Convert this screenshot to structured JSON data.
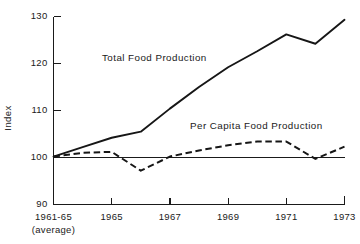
{
  "chart_data": {
    "type": "line",
    "title": "",
    "xlabel": "",
    "ylabel": "Index",
    "ylim": [
      90,
      130
    ],
    "yticks": [
      90,
      100,
      110,
      120,
      130
    ],
    "ytick_labels": [
      "90",
      "100",
      "110",
      "120",
      "130"
    ],
    "grid": false,
    "legend_position": "inline-annotation",
    "reference_line": 100,
    "x": [
      1963,
      1964,
      1965,
      1966,
      1967,
      1968,
      1969,
      1970,
      1971,
      1972,
      1973
    ],
    "xtick_positions": [
      1963,
      1965,
      1967,
      1969,
      1971,
      1973
    ],
    "xtick_labels": [
      "1961-65",
      "1965",
      "1967",
      "1969",
      "1971",
      "1973"
    ],
    "xtick_sublabel": "(average)",
    "series": [
      {
        "name": "Total Food Production",
        "style": "solid",
        "values": [
          100.2,
          102.2,
          104.2,
          105.5,
          110.4,
          115.0,
          119.2,
          122.6,
          126.2,
          124.2,
          129.3
        ]
      },
      {
        "name": "Per Capita Food Production",
        "style": "dashed",
        "values": [
          100.2,
          101.0,
          101.2,
          97.2,
          100.2,
          101.5,
          102.6,
          103.4,
          103.4,
          99.7,
          102.3
        ]
      }
    ],
    "annotations": [
      {
        "text": "Total Food Production",
        "x_px": 102,
        "y_px": 52
      },
      {
        "text": "Per Capita Food Production",
        "x_px": 190,
        "y_px": 120
      }
    ]
  },
  "axis": {
    "y_title": "Index",
    "y_labels": [
      "130",
      "120",
      "110",
      "100",
      "90"
    ],
    "x_labels": [
      "1961-65",
      "1965",
      "1967",
      "1969",
      "1971",
      "1973"
    ],
    "x_sublabel": "(average)"
  },
  "colors": {
    "ink": "#161616",
    "background": "#ffffff"
  }
}
